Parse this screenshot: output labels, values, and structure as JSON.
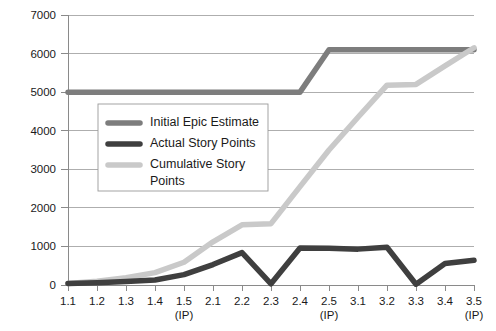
{
  "chart_data": {
    "type": "line",
    "title": "",
    "subtitle": "",
    "xlabel": "",
    "ylabel": "",
    "ylim": [
      0,
      7000
    ],
    "ytick_step": 1000,
    "yticks": [
      "0",
      "1000",
      "2000",
      "3000",
      "4000",
      "5000",
      "6000",
      "7000"
    ],
    "grid": true,
    "grid_axis": "y",
    "legend_position": "center-left",
    "categories": [
      "1.1",
      "1.2",
      "1.3",
      "1.4",
      "1.5",
      "2.1",
      "2.2",
      "2.3",
      "2.4",
      "2.5",
      "3.1",
      "3.2",
      "3.3",
      "3.4",
      "3.5"
    ],
    "category_sublabels": [
      "",
      "",
      "",
      "",
      "(IP)",
      "",
      "",
      "",
      "",
      "(IP)",
      "",
      "",
      "",
      "",
      "(IP)"
    ],
    "series": [
      {
        "name": "Initial Epic Estimate",
        "color": "#7d7d7d",
        "width": 5.5,
        "values": [
          5000,
          5000,
          5000,
          5000,
          5000,
          5000,
          5000,
          5000,
          5000,
          6100,
          6100,
          6100,
          6100,
          6100,
          6100
        ]
      },
      {
        "name": "Actual Story Points",
        "color": "#3f3f3f",
        "width": 5.5,
        "values": [
          40,
          60,
          90,
          130,
          270,
          530,
          840,
          30,
          960,
          950,
          930,
          980,
          20,
          560,
          640
        ]
      },
      {
        "name": "Cumulative Story Points",
        "color": "#c9c9c9",
        "width": 5.5,
        "values": [
          40,
          100,
          190,
          320,
          590,
          1120,
          1560,
          1590,
          2550,
          3500,
          4350,
          5180,
          5200,
          5680,
          6150
        ]
      }
    ]
  },
  "legend": {
    "items": [
      {
        "label": "Initial Epic Estimate",
        "label_line2": ""
      },
      {
        "label": "Actual Story Points",
        "label_line2": ""
      },
      {
        "label": "Cumulative Story",
        "label_line2": "Points"
      }
    ]
  }
}
